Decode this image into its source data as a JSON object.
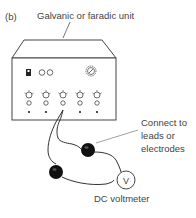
{
  "figure": {
    "panel_label": "(b)",
    "title_label": "Galvanic or faradic unit",
    "connect_label_line1": "Connect to",
    "connect_label_line2": "leads or",
    "connect_label_line3": "electrodes",
    "voltmeter_label": "DC voltmeter",
    "voltmeter_symbol": "V"
  },
  "device": {
    "switch": "toggle-switch",
    "indicator_lights": 2,
    "dial": "main-dial",
    "knob_columns": 5
  }
}
